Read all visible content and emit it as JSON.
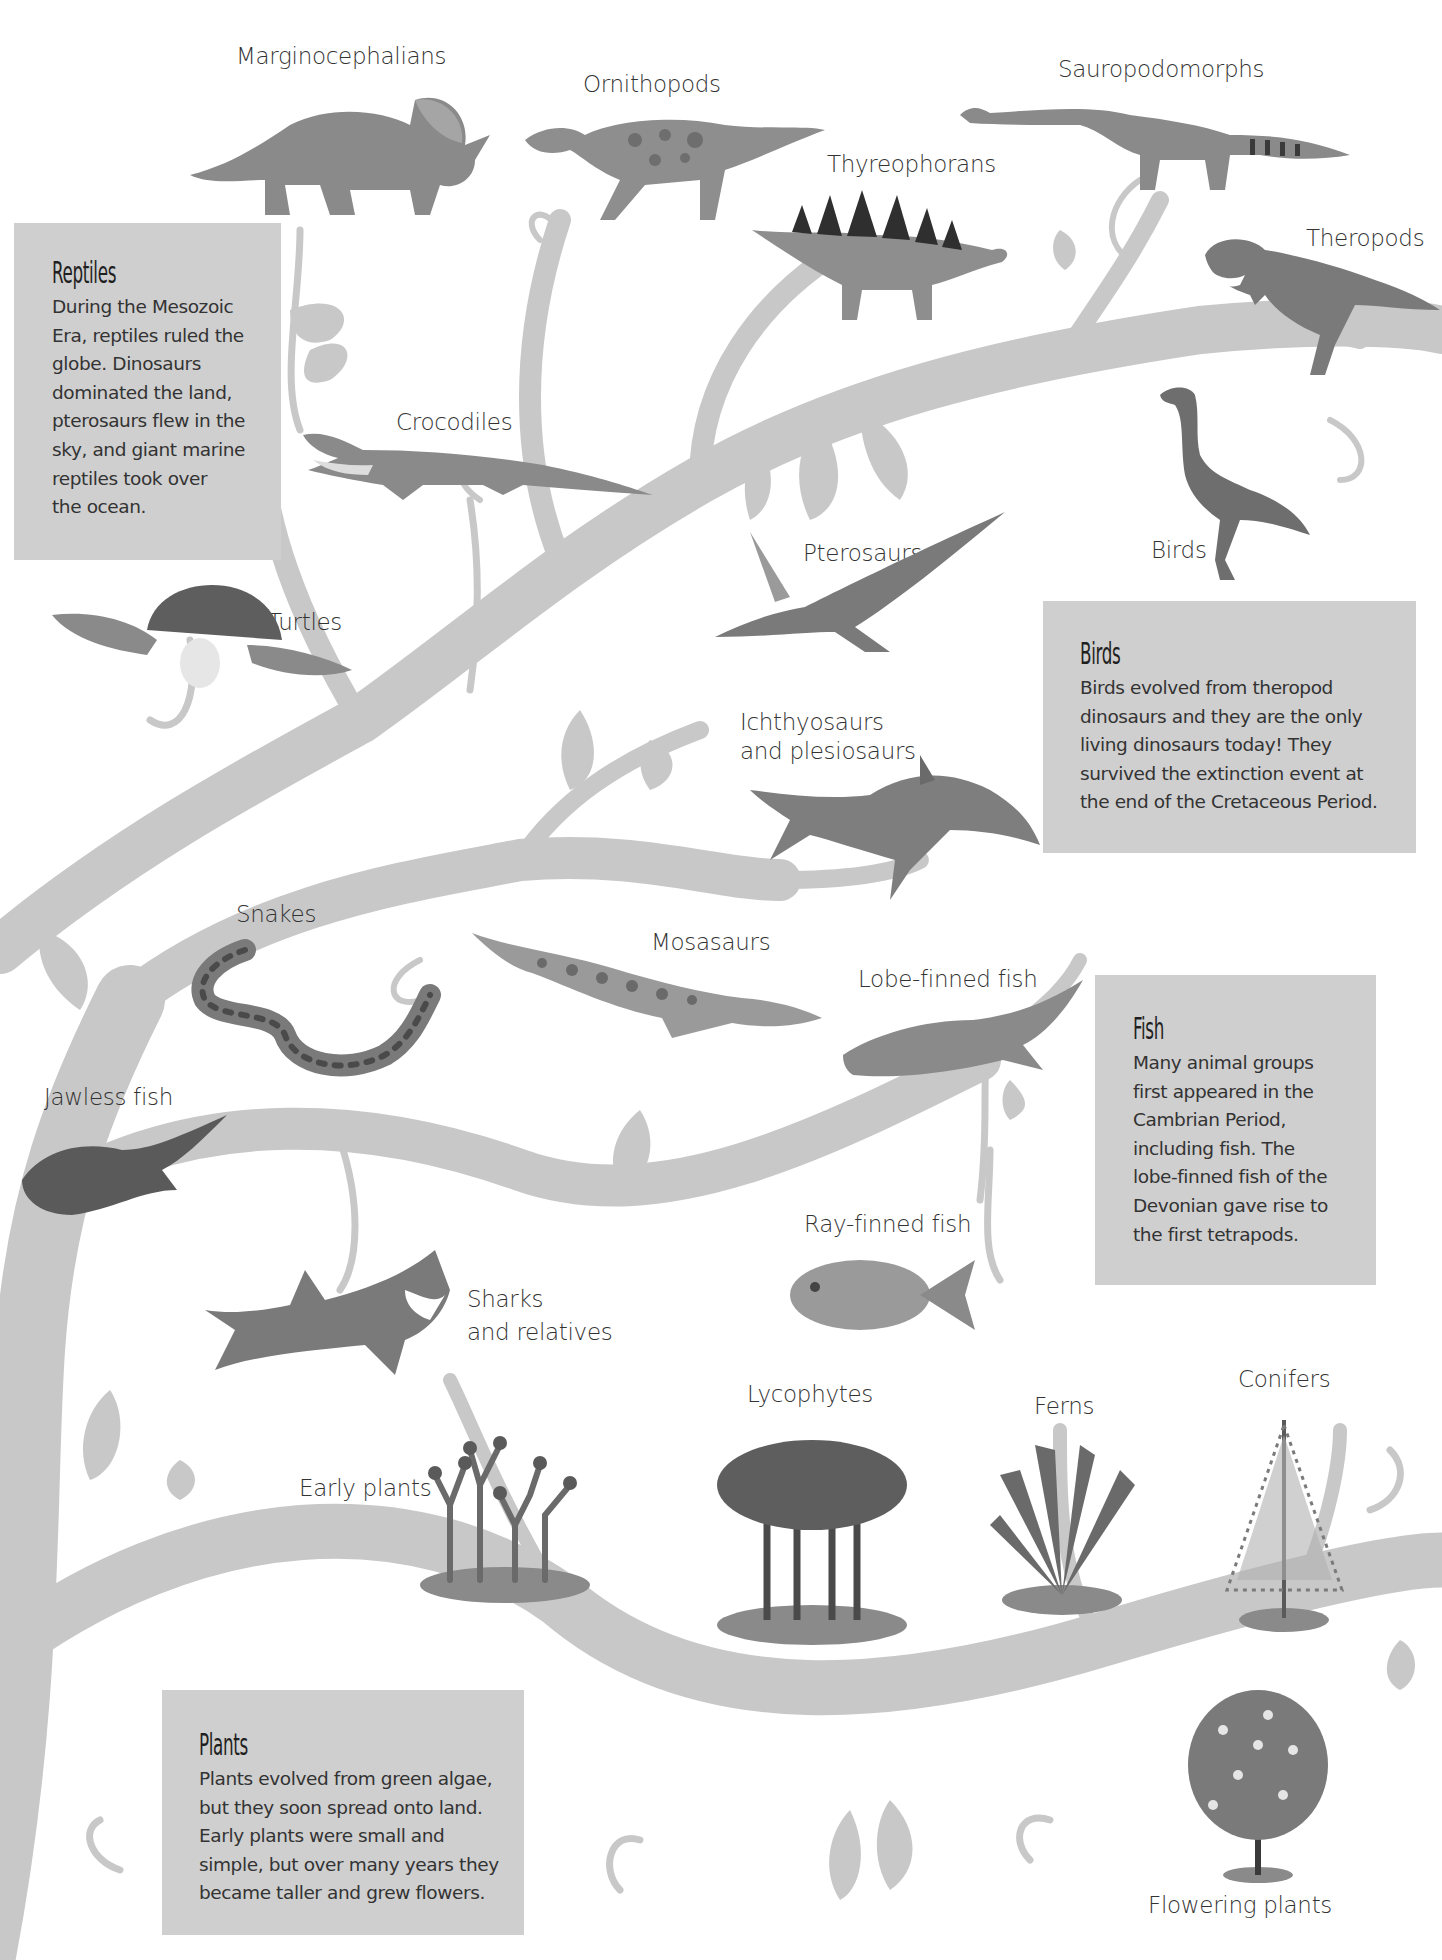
{
  "page": {
    "type": "illustrated tree of life",
    "background_color": "#ffffff",
    "branch_color": "#c8c8c8",
    "infobox_color": "#cfcfcf"
  },
  "infoboxes": {
    "reptiles": {
      "title": "Reptiles",
      "lines": [
        "During the Mesozoic",
        "Era, reptiles ruled the",
        "globe. Dinosaurs",
        "dominated the land,",
        "pterosaurs flew in the",
        "sky, and giant marine",
        "reptiles took over",
        "the ocean."
      ]
    },
    "birds": {
      "title": "Birds",
      "lines": [
        "Birds evolved from theropod",
        "dinosaurs and they are the only",
        "living dinosaurs today! They",
        "survived the extinction event at",
        "the end of the Cretaceous Period."
      ]
    },
    "fish": {
      "title": "Fish",
      "lines": [
        "Many animal groups",
        "first appeared in the",
        "Cambrian Period,",
        "including fish. The",
        "lobe-finned fish of the",
        "Devonian gave rise to",
        "the first tetrapods."
      ]
    },
    "plants": {
      "title": "Plants",
      "lines": [
        "Plants evolved from green algae,",
        "but they soon spread onto land.",
        "Early plants were small and",
        "simple, but over many years they",
        "became taller and grew flowers."
      ]
    }
  },
  "labels": {
    "marginocephalians": "Marginocephalians",
    "ornithopods": "Ornithopods",
    "sauropodomorphs": "Sauropodomorphs",
    "thyreophorans": "Thyreophorans",
    "theropods": "Theropods",
    "crocodiles": "Crocodiles",
    "birds": "Birds",
    "pterosaurs": "Pterosaurs",
    "turtles": "Turtles",
    "ichthyosaurs_line1": "Ichthyosaurs",
    "ichthyosaurs_line2": "and plesiosaurs",
    "snakes": "Snakes",
    "mosasaurs": "Mosasaurs",
    "lobe_finned_fish": "Lobe-finned fish",
    "jawless_fish": "Jawless fish",
    "ray_finned_fish": "Ray-finned fish",
    "sharks_line1": "Sharks",
    "sharks_line2": "and relatives",
    "lycophytes": "Lycophytes",
    "ferns": "Ferns",
    "conifers": "Conifers",
    "early_plants": "Early plants",
    "flowering_plants": "Flowering plants"
  },
  "icons": {
    "triceratops": "triceratops-illustration",
    "ornithopod": "hadrosaur-illustration",
    "sauropod": "sauropod-illustration",
    "stegosaurus": "stegosaurus-illustration",
    "trex": "tyrannosaurus-illustration",
    "crocodile": "crocodile-illustration",
    "bird": "flightless-bird-illustration",
    "pterosaur": "pterosaur-illustration",
    "turtle": "sea-turtle-illustration",
    "ichthyosaur": "ichthyosaur-illustration",
    "snake": "snake-illustration",
    "mosasaur": "mosasaur-illustration",
    "lobefish": "lobe-finned-fish-illustration",
    "jawless": "jawless-fish-illustration",
    "rayfish": "ray-finned-fish-illustration",
    "shark": "shark-illustration",
    "early_plant": "early-plant-illustration",
    "lycophyte": "lycophyte-illustration",
    "fern": "fern-illustration",
    "conifer": "conifer-illustration",
    "flowering": "flowering-tree-illustration"
  }
}
